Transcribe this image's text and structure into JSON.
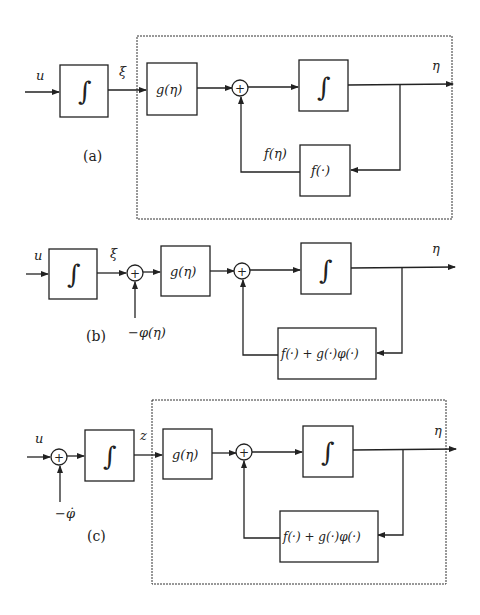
{
  "diagram": {
    "panels": [
      {
        "id": "a",
        "caption": "(a)",
        "input_label": "u",
        "integrator_symbol": "∫",
        "intermediate_label": "ξ",
        "gain_block": "g(η)",
        "sum_symbol": "+",
        "inner_integrator_symbol": "∫",
        "feedback_block": "f(·)",
        "feedback_signal_label": "f(η)",
        "output_label": "η",
        "has_dashed_box": true
      },
      {
        "id": "b",
        "caption": "(b)",
        "input_label": "u",
        "integrator_symbol": "∫",
        "intermediate_label": "ξ",
        "first_sum_symbol": "+",
        "first_sum_input": "−φ(η)",
        "gain_block": "g(η)",
        "sum_symbol": "+",
        "inner_integrator_symbol": "∫",
        "feedback_block": "f(·) + g(·)φ(·)",
        "output_label": "η",
        "has_dashed_box": false
      },
      {
        "id": "c",
        "caption": "(c)",
        "input_label": "u",
        "first_sum_symbol": "+",
        "first_sum_input": "−φ̇",
        "integrator_symbol": "∫",
        "intermediate_label": "z",
        "gain_block": "g(η)",
        "sum_symbol": "+",
        "inner_integrator_symbol": "∫",
        "feedback_block": "f(·) + g(·)φ(·)",
        "output_label": "η",
        "has_dashed_box": true
      }
    ]
  }
}
